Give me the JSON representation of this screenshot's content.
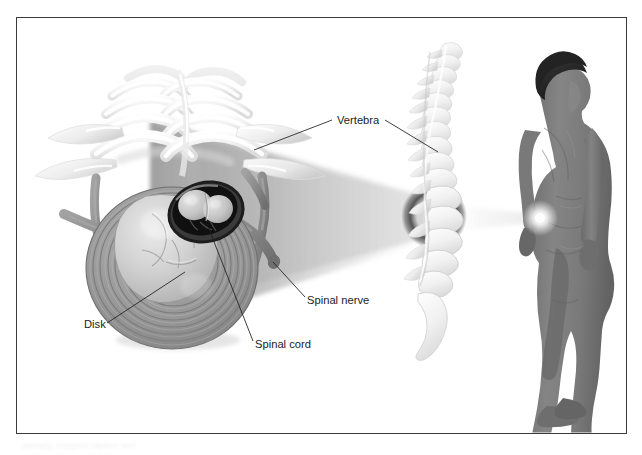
{
  "figure": {
    "border_color": "#3a3a3a",
    "background_color": "#ffffff"
  },
  "labels": [
    {
      "id": "vertebra",
      "text": "Vertebra",
      "x": 337,
      "y": 124
    },
    {
      "id": "spinal-nerve",
      "text": "Spinal nerve",
      "x": 307,
      "y": 304
    },
    {
      "id": "disk",
      "text": "Disk",
      "x": 84,
      "y": 328
    },
    {
      "id": "spinal-cord",
      "text": "Spinal cord",
      "x": 255,
      "y": 348
    }
  ],
  "leader_lines": [
    {
      "id": "vertebra-left",
      "from": [
        332,
        120
      ],
      "to": [
        254,
        150
      ]
    },
    {
      "id": "vertebra-right",
      "from": [
        385,
        120
      ],
      "to": [
        438,
        152
      ]
    },
    {
      "id": "spinal-nerve-leader",
      "from": [
        305,
        297
      ],
      "to": [
        273,
        262
      ]
    },
    {
      "id": "disk-leader",
      "from": [
        107,
        323
      ],
      "to": [
        185,
        272
      ]
    },
    {
      "id": "spinal-cord-leader",
      "from": [
        253,
        341
      ],
      "to": [
        207,
        224
      ]
    }
  ],
  "anatomy": {
    "vertebra_stack_color": "#f2f2f2",
    "disk_annulus_color": "#8f8f8f",
    "disk_nucleus_color": "#c9c9c9",
    "nerve_root_color": "#8a8a8a",
    "cord_color": "#cfcfcf",
    "body_silhouette_color": "#7c7c7c",
    "hair_color": "#2b2b2b",
    "spine_bone_color": "#ededed",
    "magnify_cone_color": "#9a9a9a",
    "highlight_glow_color": "#ffffff"
  },
  "views": [
    {
      "id": "cross-section",
      "name": "Axial cross-section of vertebra with herniated disk"
    },
    {
      "id": "spine-lateral",
      "name": "Lateral view of vertebral column"
    },
    {
      "id": "body-silhouette",
      "name": "Standing human figure, posterior-lateral view"
    }
  ],
  "caption_fragment": "partially cropped caption text"
}
